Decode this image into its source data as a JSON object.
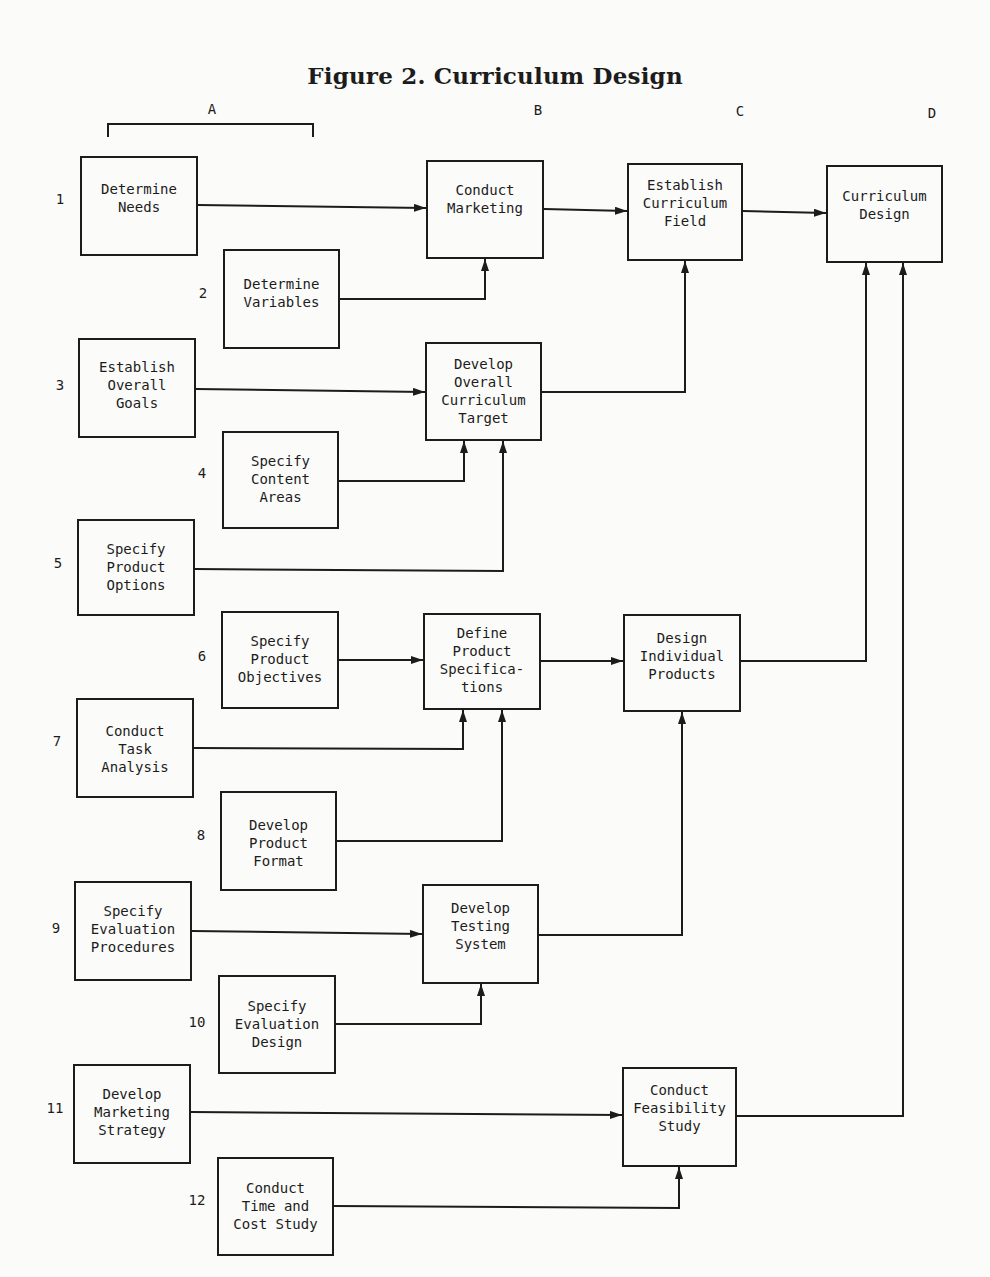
{
  "title": "Figure 2. Curriculum Design",
  "columns": [
    {
      "id": "A",
      "label": "A",
      "x": 212,
      "y": 101
    },
    {
      "id": "B",
      "label": "B",
      "x": 538,
      "y": 102
    },
    {
      "id": "C",
      "label": "C",
      "x": 740,
      "y": 103
    },
    {
      "id": "D",
      "label": "D",
      "x": 932,
      "y": 105
    }
  ],
  "bracket": {
    "x": 107,
    "y": 123,
    "w": 207,
    "h": 14
  },
  "row_labels": [
    {
      "label": "1",
      "x": 60,
      "y": 199
    },
    {
      "label": "2",
      "x": 203,
      "y": 293
    },
    {
      "label": "3",
      "x": 60,
      "y": 385
    },
    {
      "label": "4",
      "x": 202,
      "y": 473
    },
    {
      "label": "5",
      "x": 58,
      "y": 563
    },
    {
      "label": "6",
      "x": 202,
      "y": 656
    },
    {
      "label": "7",
      "x": 57,
      "y": 741
    },
    {
      "label": "8",
      "x": 201,
      "y": 835
    },
    {
      "label": "9",
      "x": 56,
      "y": 928
    },
    {
      "label": "10",
      "x": 197,
      "y": 1022
    },
    {
      "label": "11",
      "x": 55,
      "y": 1108
    },
    {
      "label": "12",
      "x": 197,
      "y": 1200
    }
  ],
  "boxes": [
    {
      "id": "determine-needs",
      "step": "1",
      "lines": [
        "Determine",
        "Needs"
      ],
      "x": 80,
      "y": 156,
      "w": 118,
      "h": 100,
      "pad": 22
    },
    {
      "id": "determine-variables",
      "step": "2",
      "lines": [
        "Determine",
        "Variables"
      ],
      "x": 223,
      "y": 249,
      "w": 117,
      "h": 100,
      "pad": 24
    },
    {
      "id": "establish-overall-goals",
      "step": "3",
      "lines": [
        "Establish",
        "Overall",
        "Goals"
      ],
      "x": 78,
      "y": 338,
      "w": 118,
      "h": 100,
      "pad": 18
    },
    {
      "id": "specify-content-areas",
      "step": "4",
      "lines": [
        "Specify",
        "Content",
        "Areas"
      ],
      "x": 222,
      "y": 431,
      "w": 117,
      "h": 98,
      "pad": 19
    },
    {
      "id": "specify-product-options",
      "step": "5",
      "lines": [
        "Specify",
        "Product",
        "Options"
      ],
      "x": 77,
      "y": 519,
      "w": 118,
      "h": 97,
      "pad": 19
    },
    {
      "id": "specify-product-objectives",
      "step": "6",
      "lines": [
        "Specify",
        "Product",
        "Objectives"
      ],
      "x": 221,
      "y": 611,
      "w": 118,
      "h": 98,
      "pad": 19
    },
    {
      "id": "conduct-task-analysis",
      "step": "7",
      "lines": [
        "Conduct",
        "Task",
        "Analysis"
      ],
      "x": 76,
      "y": 698,
      "w": 118,
      "h": 100,
      "pad": 22
    },
    {
      "id": "develop-product-format",
      "step": "8",
      "lines": [
        "Develop",
        "Product",
        "Format"
      ],
      "x": 220,
      "y": 791,
      "w": 117,
      "h": 100,
      "pad": 23
    },
    {
      "id": "specify-evaluation-procedures",
      "step": "9",
      "lines": [
        "Specify",
        "Evaluation",
        "Procedures"
      ],
      "x": 74,
      "y": 881,
      "w": 118,
      "h": 100,
      "pad": 19
    },
    {
      "id": "specify-evaluation-design",
      "step": "10",
      "lines": [
        "Specify",
        "Evaluation",
        "Design"
      ],
      "x": 218,
      "y": 975,
      "w": 118,
      "h": 99,
      "pad": 20
    },
    {
      "id": "develop-marketing-strategy",
      "step": "11",
      "lines": [
        "Develop",
        "Marketing",
        "Strategy"
      ],
      "x": 73,
      "y": 1064,
      "w": 118,
      "h": 100,
      "pad": 19
    },
    {
      "id": "conduct-time-and-cost-study",
      "step": "12",
      "lines": [
        "Conduct",
        "Time and",
        "Cost Study"
      ],
      "x": 217,
      "y": 1157,
      "w": 117,
      "h": 99,
      "pad": 20
    },
    {
      "id": "conduct-marketing",
      "column": "B",
      "lines": [
        "Conduct",
        "Marketing"
      ],
      "x": 426,
      "y": 160,
      "w": 118,
      "h": 99,
      "pad": 19
    },
    {
      "id": "develop-overall-curriculum-target",
      "column": "B",
      "lines": [
        "Develop",
        "Overall",
        "Curriculum",
        "Target"
      ],
      "x": 425,
      "y": 342,
      "w": 117,
      "h": 99,
      "pad": 11
    },
    {
      "id": "define-product-specifications",
      "column": "B",
      "lines": [
        "Define",
        "Product",
        "Specifica-",
        "tions"
      ],
      "x": 423,
      "y": 613,
      "w": 118,
      "h": 97,
      "pad": 9
    },
    {
      "id": "develop-testing-system",
      "column": "B",
      "lines": [
        "Develop",
        "Testing",
        "System"
      ],
      "x": 422,
      "y": 884,
      "w": 117,
      "h": 100,
      "pad": 13
    },
    {
      "id": "establish-curriculum-field",
      "column": "C",
      "lines": [
        "Establish",
        "Curriculum",
        "Field"
      ],
      "x": 627,
      "y": 163,
      "w": 116,
      "h": 98,
      "pad": 11
    },
    {
      "id": "design-individual-products",
      "column": "C",
      "lines": [
        "Design",
        "Individual",
        "Products"
      ],
      "x": 623,
      "y": 614,
      "w": 118,
      "h": 98,
      "pad": 13
    },
    {
      "id": "conduct-feasibility-study",
      "column": "C",
      "lines": [
        "Conduct",
        "Feasibility",
        "Study"
      ],
      "x": 622,
      "y": 1067,
      "w": 115,
      "h": 100,
      "pad": 12
    },
    {
      "id": "curriculum-design",
      "column": "D",
      "lines": [
        "Curriculum",
        "Design"
      ],
      "x": 826,
      "y": 165,
      "w": 117,
      "h": 98,
      "pad": 20
    }
  ],
  "connectors": [
    {
      "from": "determine-needs",
      "to": "conduct-marketing",
      "points": "198,205 426,208"
    },
    {
      "from": "determine-variables",
      "to": "conduct-marketing",
      "points": "340,299 485,299 485,259"
    },
    {
      "from": "conduct-marketing",
      "to": "establish-curriculum-field",
      "points": "544,209 627,211"
    },
    {
      "from": "establish-curriculum-field",
      "to": "curriculum-design",
      "points": "743,211 826,213"
    },
    {
      "from": "establish-overall-goals",
      "to": "develop-overall-curriculum-target",
      "points": "196,389 425,392"
    },
    {
      "from": "develop-overall-curriculum-target",
      "to": "establish-curriculum-field",
      "points": "542,392 685,392 685,261"
    },
    {
      "from": "specify-content-areas",
      "to": "develop-overall-curriculum-target",
      "points": "339,481 464,481 464,441"
    },
    {
      "from": "specify-product-options",
      "to": "develop-overall-curriculum-target",
      "points": "195,569 503,571 503,441"
    },
    {
      "from": "specify-product-objectives",
      "to": "define-product-specifications",
      "points": "339,660 423,660"
    },
    {
      "from": "define-product-specifications",
      "to": "design-individual-products",
      "points": "541,661 623,661"
    },
    {
      "from": "design-individual-products",
      "to": "curriculum-design",
      "points": "741,661 866,661 866,263"
    },
    {
      "from": "conduct-task-analysis",
      "to": "define-product-specifications",
      "points": "194,748 463,749 463,710"
    },
    {
      "from": "develop-product-format",
      "to": "define-product-specifications",
      "points": "337,841 502,841 502,710"
    },
    {
      "from": "specify-evaluation-procedures",
      "to": "develop-testing-system",
      "points": "192,931 422,934"
    },
    {
      "from": "develop-testing-system",
      "to": "design-individual-products",
      "points": "539,935 682,935 682,712"
    },
    {
      "from": "specify-evaluation-design",
      "to": "develop-testing-system",
      "points": "336,1024 481,1024 481,984"
    },
    {
      "from": "develop-marketing-strategy",
      "to": "conduct-feasibility-study",
      "points": "191,1112 622,1115"
    },
    {
      "from": "conduct-time-and-cost-study",
      "to": "conduct-feasibility-study",
      "points": "334,1206 679,1208 679,1167"
    },
    {
      "from": "conduct-feasibility-study",
      "to": "curriculum-design",
      "points": "737,1116 903,1116 903,263"
    }
  ]
}
